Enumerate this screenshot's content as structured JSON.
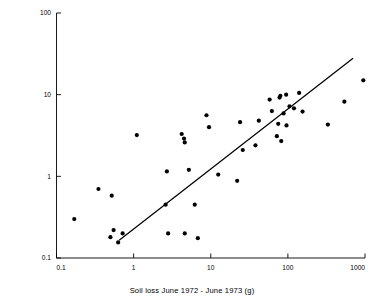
{
  "figure": {
    "name": "soil-loss-scatter-plot",
    "background": "#ffffff",
    "ink": "#000000"
  },
  "axes": {
    "x_title": "Soil loss June 1972 - June 1973 (g)",
    "y_title": "Bare soil  % x sine slope angle",
    "x_ticks": [
      "0.1",
      "1",
      "10",
      "100",
      "1000"
    ],
    "y_ticks": [
      "0.1",
      "1",
      "10",
      "100"
    ]
  },
  "chart_data": {
    "type": "scatter",
    "title": "",
    "xlabel": "Soil loss June 1972 - June 1973 (g)",
    "ylabel": "Bare soil  % x sine slope angle",
    "xscale": "log",
    "yscale": "log",
    "xlim": [
      0.1,
      1000
    ],
    "ylim": [
      0.1,
      100
    ],
    "xticks": [
      0.1,
      1,
      10,
      100,
      1000
    ],
    "yticks": [
      0.1,
      1,
      10,
      100
    ],
    "grid": false,
    "legend": "none",
    "marker": "filled-circle",
    "marker_color": "#000000",
    "marker_size_px": 3.2,
    "points": [
      [
        0.17,
        0.3
      ],
      [
        0.35,
        0.7
      ],
      [
        0.5,
        0.18
      ],
      [
        0.52,
        0.58
      ],
      [
        0.55,
        0.22
      ],
      [
        0.63,
        0.155
      ],
      [
        0.72,
        0.2
      ],
      [
        1.1,
        3.2
      ],
      [
        2.6,
        0.45
      ],
      [
        2.8,
        0.2
      ],
      [
        2.7,
        1.15
      ],
      [
        4.2,
        3.3
      ],
      [
        4.5,
        2.9
      ],
      [
        4.6,
        2.6
      ],
      [
        4.6,
        0.2
      ],
      [
        5.2,
        1.2
      ],
      [
        6.2,
        0.45
      ],
      [
        6.8,
        0.175
      ],
      [
        8.8,
        5.6
      ],
      [
        9.5,
        4.0
      ],
      [
        12.5,
        1.05
      ],
      [
        22.0,
        0.88
      ],
      [
        24.0,
        4.6
      ],
      [
        26.0,
        2.1
      ],
      [
        38.0,
        2.4
      ],
      [
        42.0,
        4.8
      ],
      [
        58.0,
        8.7
      ],
      [
        62.0,
        6.3
      ],
      [
        72.0,
        3.1
      ],
      [
        75.0,
        4.4
      ],
      [
        78.0,
        9.2
      ],
      [
        80.0,
        9.7
      ],
      [
        82.0,
        2.7
      ],
      [
        88.0,
        5.9
      ],
      [
        95.0,
        10.0
      ],
      [
        96.0,
        4.2
      ],
      [
        105.0,
        7.2
      ],
      [
        120.0,
        6.8
      ],
      [
        140.0,
        10.5
      ],
      [
        155.0,
        6.2
      ],
      [
        330.0,
        4.3
      ],
      [
        540.0,
        8.2
      ],
      [
        950.0,
        15.0
      ]
    ],
    "trend_line": {
      "type": "linear-fit-loglog",
      "x_start": 0.65,
      "y_start": 0.165,
      "x_end": 700,
      "y_end": 28.0
    }
  }
}
